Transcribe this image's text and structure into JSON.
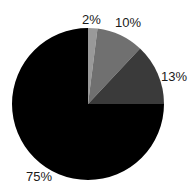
{
  "chart_data": {
    "type": "pie",
    "title": "",
    "xlabel": "",
    "ylabel": "",
    "labels": [
      "2%",
      "10%",
      "13%",
      "75%"
    ],
    "values": [
      2,
      10,
      13,
      75
    ],
    "categories": [
      "2%",
      "10%",
      "13%",
      "75%"
    ],
    "slice_colors": [
      "#999999",
      "#707070",
      "#3a3a3a",
      "#000000"
    ],
    "start_angle_deg": 0,
    "direction": "clockwise",
    "legend": "none",
    "grid": false,
    "labels_position": "outside",
    "background_color": "#ffffff",
    "label_text_color": "#1a1a1a"
  },
  "geometry": {
    "center_x": 88,
    "center_y": 104,
    "radius": 76
  }
}
